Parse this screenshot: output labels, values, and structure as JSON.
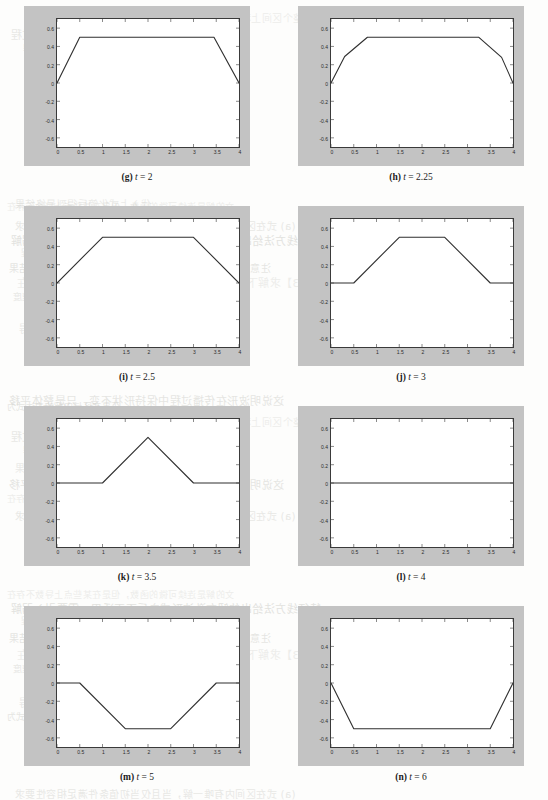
{
  "figure": {
    "panel_count": 8,
    "axis": {
      "xticks": [
        "0",
        "0.5",
        "1",
        "1.5",
        "2",
        "2.5",
        "3",
        "3.5",
        "4"
      ],
      "xtick_values": [
        0,
        0.5,
        1,
        1.5,
        2,
        2.5,
        3,
        3.5,
        4
      ],
      "yticks": [
        "0.6",
        "0.4",
        "0.2",
        "0",
        "-0.2",
        "-0.4",
        "-0.6"
      ],
      "ytick_values": [
        0.6,
        0.4,
        0.2,
        0,
        -0.2,
        -0.4,
        -0.6
      ],
      "xlim": [
        0,
        4
      ],
      "ylim": [
        -0.7,
        0.7
      ]
    },
    "colors": {
      "frame": "#c3c3c3",
      "plot_bg": "#ffffff",
      "axis_line": "#3a3a3a",
      "curve": "#2f2f2f",
      "page_bg": "#fdfdfc"
    },
    "panels": [
      {
        "key": "g",
        "label": "(g)",
        "var": "t",
        "eq": "=",
        "value": "2",
        "caption": "(g) t = 2"
      },
      {
        "key": "h",
        "label": "(h)",
        "var": "t",
        "eq": "=",
        "value": "2.25",
        "caption": "(h) t = 2.25"
      },
      {
        "key": "i",
        "label": "(i)",
        "var": "t",
        "eq": "=",
        "value": "2.5",
        "caption": "(i) t = 2.5"
      },
      {
        "key": "j",
        "label": "(j)",
        "var": "t",
        "eq": "=",
        "value": "3",
        "caption": "(j) t = 3"
      },
      {
        "key": "k",
        "label": "(k)",
        "var": "t",
        "eq": "=",
        "value": "3.5",
        "caption": "(k) t = 3.5"
      },
      {
        "key": "l",
        "label": "(l)",
        "var": "t",
        "eq": "=",
        "value": "4",
        "caption": "(l) t = 4"
      },
      {
        "key": "m",
        "label": "(m)",
        "var": "t",
        "eq": "=",
        "value": "5",
        "caption": "(m) t = 5"
      },
      {
        "key": "n",
        "label": "(n)",
        "var": "t",
        "eq": "=",
        "value": "6",
        "caption": "(n) t = 6"
      }
    ]
  },
  "chart_data": [
    {
      "type": "line",
      "title": "(g) t = 2",
      "xlabel": "",
      "ylabel": "",
      "xlim": [
        0,
        4
      ],
      "ylim": [
        -0.7,
        0.7
      ],
      "grid": false,
      "legend": "none",
      "x": [
        0,
        0.5,
        3.45,
        4
      ],
      "y": [
        0,
        0.5,
        0.5,
        0
      ]
    },
    {
      "type": "line",
      "title": "(h) t = 2.25",
      "xlabel": "",
      "ylabel": "",
      "xlim": [
        0,
        4
      ],
      "ylim": [
        -0.7,
        0.7
      ],
      "grid": false,
      "legend": "none",
      "x": [
        0,
        0.3,
        0.8,
        3.25,
        3.75,
        4
      ],
      "y": [
        0,
        0.29,
        0.5,
        0.5,
        0.28,
        0
      ]
    },
    {
      "type": "line",
      "title": "(i) t = 2.5",
      "xlabel": "",
      "ylabel": "",
      "xlim": [
        0,
        4
      ],
      "ylim": [
        -0.7,
        0.7
      ],
      "grid": false,
      "legend": "none",
      "x": [
        0,
        1,
        3,
        4
      ],
      "y": [
        0,
        0.5,
        0.5,
        0
      ]
    },
    {
      "type": "line",
      "title": "(j) t = 3",
      "xlabel": "",
      "ylabel": "",
      "xlim": [
        0,
        4
      ],
      "ylim": [
        -0.7,
        0.7
      ],
      "grid": false,
      "legend": "none",
      "x": [
        0,
        0.5,
        1.5,
        2.5,
        3.5,
        4
      ],
      "y": [
        0,
        0,
        0.5,
        0.5,
        0,
        0
      ]
    },
    {
      "type": "line",
      "title": "(k) t = 3.5",
      "xlabel": "",
      "ylabel": "",
      "xlim": [
        0,
        4
      ],
      "ylim": [
        -0.7,
        0.7
      ],
      "grid": false,
      "legend": "none",
      "x": [
        0,
        1,
        2,
        3,
        4
      ],
      "y": [
        0,
        0,
        0.5,
        0,
        0
      ]
    },
    {
      "type": "line",
      "title": "(l) t = 4",
      "xlabel": "",
      "ylabel": "",
      "xlim": [
        0,
        4
      ],
      "ylim": [
        -0.7,
        0.7
      ],
      "grid": false,
      "legend": "none",
      "x": [
        0,
        4
      ],
      "y": [
        0,
        0
      ]
    },
    {
      "type": "line",
      "title": "(m) t = 5",
      "xlabel": "",
      "ylabel": "",
      "xlim": [
        0,
        4
      ],
      "ylim": [
        -0.7,
        0.7
      ],
      "grid": false,
      "legend": "none",
      "x": [
        0,
        0.5,
        1.5,
        2.5,
        3.5,
        4
      ],
      "y": [
        0,
        0,
        -0.5,
        -0.5,
        0,
        0
      ]
    },
    {
      "type": "line",
      "title": "(n) t = 6",
      "xlabel": "",
      "ylabel": "",
      "xlim": [
        0,
        4
      ],
      "ylim": [
        -0.7,
        0.7
      ],
      "grid": false,
      "legend": "none",
      "x": [
        0,
        0.5,
        3.5,
        4
      ],
      "y": [
        0,
        -0.5,
        -0.5,
        0
      ]
    }
  ],
  "background_bleed": {
    "note": "faint mirrored show-through text from reverse of page",
    "lines": [
      "文的解是连续可微的函数，但是在某些点上导数不存在",
      "(a) 式在区间内有唯一解，当且仅当初值条件满足相容性要求",
      "特征线方法给出的解在激波形成之后不再适用，需要引入弱解",
      "的概念，即满足积分形式的守恒律方程",
      "注意到解在有限时间内形成间断，这是非线性效应的结果",
      "【例 2.3】求解下面的初边值问题，并讨论解的光滑性，说明在",
      "何处出现间断，以及间断沿特征线的传播速度",
      "其中 u(x,t) 与 v(x,t) 满足相容性条件",
      "解 由特征线方程可得",
      "于是在区域内解的表达式为",
      "在整个区间上积分可得守恒量保持不变，从而验证了数值格式",
      "的守恒性，下面给出具体的推导过程",
      "利用分部积分并注意边界条件为零，即得",
      "代入上式化简后得到最终结果",
      "这说明波形在传播过程中保持形状不变，只是整体平移"
    ]
  }
}
